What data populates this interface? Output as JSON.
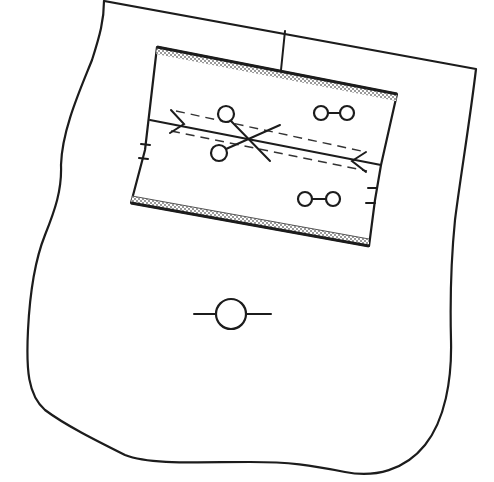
{
  "diagram": {
    "type": "sewing-pattern-piece",
    "description": "Garment front piece with a rectangular welt pocket; pocket has interfacing bands at top and bottom edges, center cutting line with scissors, dashed stitching lines, arrow tacks at both ends, button/buttonhole pairs and notch marks; large buttonhole symbol below pocket",
    "colors": {
      "stroke": "#1c1c1c",
      "background": "#ffffff",
      "interfacing_hatch": "#9a9a9a"
    },
    "elements": {
      "outer_piece": {
        "label": ""
      },
      "center_seam_line": {
        "label": ""
      },
      "pocket": {
        "label": ""
      },
      "top_interfacing": {
        "label": ""
      },
      "bottom_interfacing": {
        "label": ""
      },
      "cut_line": {
        "label": ""
      },
      "stitch_line_upper": {
        "label": ""
      },
      "stitch_line_lower": {
        "label": ""
      },
      "scissors_icon": {
        "label": ""
      },
      "button_pairs": 2,
      "notches_left": 2,
      "notches_right": 2,
      "large_buttonhole": {
        "label": ""
      }
    }
  }
}
